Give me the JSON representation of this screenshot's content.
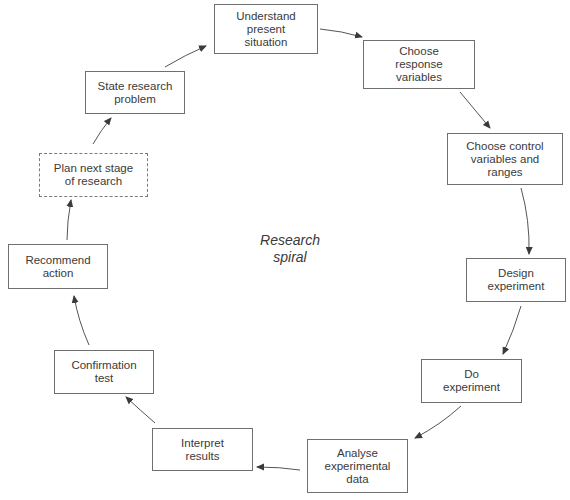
{
  "diagram": {
    "title": "Research spiral",
    "center_label": "Research\nspiral",
    "colors": {
      "box_border": "#6f6f6f",
      "text": "#3a3a3a",
      "arrow": "#4a4a4a",
      "background": "#ffffff"
    },
    "nodes": [
      {
        "id": "understand",
        "label": "Understand\npresent\nsituation",
        "style": "solid"
      },
      {
        "id": "response",
        "label": "Choose\nresponse\nvariables",
        "style": "solid"
      },
      {
        "id": "control",
        "label": "Choose control\nvariables and\nranges",
        "style": "solid"
      },
      {
        "id": "design",
        "label": "Design\nexperiment",
        "style": "solid"
      },
      {
        "id": "do",
        "label": "Do\nexperiment",
        "style": "solid"
      },
      {
        "id": "analyse",
        "label": "Analyse\nexperimental\ndata",
        "style": "solid"
      },
      {
        "id": "interpret",
        "label": "Interpret\nresults",
        "style": "solid"
      },
      {
        "id": "confirm",
        "label": "Confirmation\ntest",
        "style": "solid"
      },
      {
        "id": "recommend",
        "label": "Recommend\naction",
        "style": "solid"
      },
      {
        "id": "plan",
        "label": "Plan next stage\nof research",
        "style": "dashed"
      },
      {
        "id": "state",
        "label": "State research\nproblem",
        "style": "solid"
      }
    ],
    "edges": [
      {
        "from": "understand",
        "to": "response"
      },
      {
        "from": "response",
        "to": "control"
      },
      {
        "from": "control",
        "to": "design"
      },
      {
        "from": "design",
        "to": "do"
      },
      {
        "from": "do",
        "to": "analyse"
      },
      {
        "from": "analyse",
        "to": "interpret"
      },
      {
        "from": "interpret",
        "to": "confirm"
      },
      {
        "from": "confirm",
        "to": "recommend"
      },
      {
        "from": "recommend",
        "to": "plan"
      },
      {
        "from": "plan",
        "to": "state"
      },
      {
        "from": "state",
        "to": "understand"
      }
    ]
  }
}
